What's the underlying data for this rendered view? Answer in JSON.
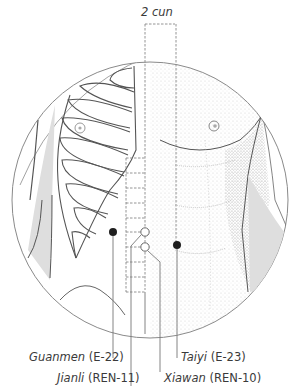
{
  "figure": {
    "measure_label": "2 cun",
    "points": [
      {
        "name": "Guanmen",
        "code": "(E-22)",
        "marker": "filled"
      },
      {
        "name": "Jianli",
        "code": "(REN-11)",
        "marker": "open"
      },
      {
        "name": "Taiyi",
        "code": "(E-23)",
        "marker": "filled"
      },
      {
        "name": "Xiawan",
        "code": "(REN-10)",
        "marker": "open"
      }
    ],
    "colors": {
      "line": "#6e6e6e",
      "dot": "#1e1e1e",
      "stipple": "#9a9a9a",
      "shade": "#dcdcdc"
    }
  }
}
